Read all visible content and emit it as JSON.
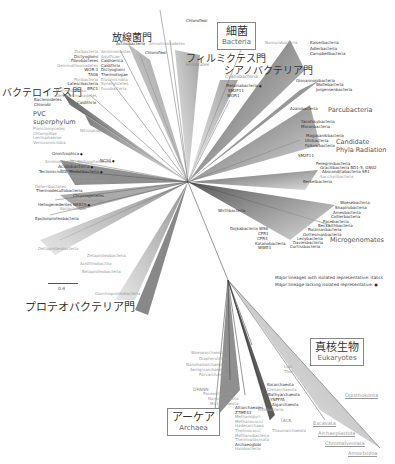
{
  "domains": {
    "bacteria": {
      "jp": "細菌",
      "en": "Bacteria"
    },
    "archaea": {
      "jp": "アーケア",
      "en": "Archaea"
    },
    "eukaryotes": {
      "jp": "真核生物",
      "en": "Eukaryotes"
    }
  },
  "phyla_jp": {
    "actinobacteria": {
      "jp": "放線菌門",
      "en": "Actinobacteria"
    },
    "firmicutes": {
      "jp": "フィルミクテス門",
      "en": "Firmicutes"
    },
    "cyanobacteria": {
      "jp": "シアノバクテリア門",
      "en": "Cyanobacteria"
    },
    "bacteroidetes": {
      "jp": "バクテロイデス門"
    },
    "proteobacteria": {
      "jp": "プロテオバクテリア門"
    }
  },
  "groups": {
    "pvc": "PVC",
    "pvc2": "superphylum",
    "parcubacteria": "Parcubacteria",
    "cpr1": "Candidate",
    "cpr2": "Phyla Radiation",
    "microgenomates": "Microgenomates",
    "dpann": "DPANN",
    "tack": "TACK"
  },
  "labels": {
    "chloroflexi": "Chloroflexi",
    "armatimonadetes": "Armatimonadetes",
    "deinococcus": "Deinococcus-Therm.",
    "top_left_col1": [
      "Zixibacteria",
      "Dictyoglomi",
      "Fibrobacteres",
      "Gemmatimonadetes",
      "WOR-3",
      "TA06",
      "Poribacteria",
      "Latescibacteria",
      "BRC1"
    ],
    "top_left_col2": [
      "Aminicenantes",
      "Aquificae",
      "Caldiserica",
      "Caldithrix",
      "Dictyoglomi",
      "Thermotogae",
      "Elusimicrobia",
      "Synergistetes",
      "Fusobacteria"
    ],
    "bacteroidetes_group": [
      "Marinimicrobia",
      "Gemmatimonadetes",
      "Bacteroidetes",
      "Chlorobi",
      "Caldithrix"
    ],
    "pvc_members": [
      "Planctomycetes",
      "Chlamydiae",
      "Lentisphaerae",
      "Verrucomicrobia"
    ],
    "nitrospirae": "Nitrospirae",
    "mid_left": [
      "Omnitrophica",
      "Aminicenantes, Kiritimatiellaeota",
      "NC10",
      "Acidobacteria",
      "Tectomicrobia, Modulibacteria",
      "Nitrospinae",
      "Chrysiogenetes",
      "Deferribacteres",
      "Thermodesulfobacteria",
      "Chrysiogenetes",
      "Hydrogenedentes",
      "Heliogenedentes NKB19",
      "Spirochaetes",
      "Epsilonproteobacteria"
    ],
    "proteo_classes": [
      "Deltaproteobacteria",
      "Zetaproteobacteria",
      "Acidithiobacillia",
      "Betaproteobacteria",
      "Gammaproteobacteria"
    ],
    "cyano_near": [
      "Melainabacteria",
      "SM2F11",
      "WOR1"
    ],
    "top_right": [
      "Nomurabacteria",
      "Kaiserbacteria",
      "Adlerbacteria",
      "Campbellbacteria",
      "Giovannonibacteria",
      "Wolfebacteria",
      "Jorgensenbacteria",
      "Azambacteria",
      "Yanofskybacteria",
      "Moranbacteria",
      "Magasanikbacteria",
      "Uhrbacteria",
      "Falkowbacteria",
      "SM2F11",
      "Peregrinibacteria",
      "Gracilibacteria BD1-5, GN02",
      "Absconditabacteria SR1",
      "Saccharibacteria",
      "Berkelbacteria"
    ],
    "micro_list": [
      "Woesebacteria",
      "Shapirobacteria",
      "Amesbacteria",
      "Collierbacteria",
      "Pacebacteria",
      "Beckwithbacteria",
      "Roizmanbacteria",
      "Gottesmanbacteria",
      "Levybacteria",
      "Daviesbacteria",
      "Curtissbacteria",
      "Dojkabacteria WS6",
      "CPR1",
      "CPR3",
      "Katanobacteria",
      "WWE3"
    ],
    "wirthbacteria": "Wirthbacteria",
    "archaea_dpann": [
      "Woesearchaeota",
      "Diapherotrites",
      "Nanohaloarchaeota",
      "Aenigmarchaeota",
      "Parvarchaeota",
      "Pacearchaeota",
      "Nanoarchaeota",
      "Micrarchaeota"
    ],
    "archaea_tack": [
      "Korarchaeota",
      "Crenarchaeota",
      "Bathyarchaeota",
      "YNPFFA",
      "Aigarchaeota",
      "Thaumarchaeota"
    ],
    "archaea_euryo": [
      "Altiarchaeales",
      "Z7ME43",
      "Methanopyri",
      "Methanococci",
      "Hadesarchaea",
      "Thermococci",
      "Methanobacteria",
      "Thermoplasmata",
      "Archaeoglobi",
      "Halobacteria"
    ],
    "loki": [
      "Loki",
      "Thor"
    ],
    "thaumarchaeota": "Thaumarchaeota",
    "halobacteria": "Halobacteria",
    "chloroflexi_top": "Chloroflexi"
  },
  "eukaryote_groups": [
    "Opisthokonta",
    "Excavata",
    "Archaeplastida",
    "Chromalveolata",
    "Amoebozoa"
  ],
  "legend": {
    "line1": "Major lineages with isolated representative: italics",
    "line2": "Major lineage lacking isolated representative:"
  },
  "scale": "0.4",
  "colors": {
    "text": "#333333",
    "gray_text": "#9a9a9a",
    "branch_dark": "#333333",
    "branch_light": "#b0b0b0"
  }
}
